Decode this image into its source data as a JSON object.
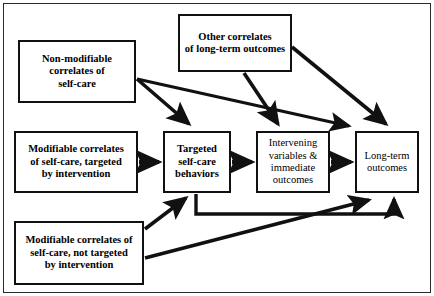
{
  "figure": {
    "background": "#ffffff",
    "line_color": "#111111",
    "border_color": "#2b2b2b",
    "width": 434,
    "height": 296
  },
  "nodes": {
    "non_modifiable": {
      "id": "non-modifiable-correlates",
      "lines": [
        "Non-modifiable",
        "correlates of",
        "self-care"
      ],
      "text": "Non-modifiable correlates of self-care",
      "style": "bold"
    },
    "other_correlates": {
      "id": "other-correlates",
      "lines": [
        "Other correlates",
        "of long-term outcomes"
      ],
      "text": "Other correlates of long-term outcomes",
      "style": "bold"
    },
    "modifiable_targeted": {
      "id": "modifiable-correlates-targeted",
      "lines": [
        "Modifiable correlates",
        "of self-care, targeted",
        "by intervention"
      ],
      "text": "Modifiable correlates of self-care, targeted by intervention",
      "style": "bold"
    },
    "modifiable_not_targeted": {
      "id": "modifiable-correlates-not-targeted",
      "lines": [
        "Modifiable correlates of",
        "self-care, not targeted",
        "by intervention"
      ],
      "text": "Modifiable correlates of self-care, not targeted by intervention",
      "style": "bold"
    },
    "targeted_behaviors": {
      "id": "targeted-self-care-behaviors",
      "lines": [
        "Targeted",
        "self-care",
        "behaviors"
      ],
      "text": "Targeted self-care behaviors",
      "style": "bold"
    },
    "intervening": {
      "id": "intervening-variables",
      "lines": [
        "Intervening",
        "variables &",
        "immediate",
        "outcomes"
      ],
      "text": "Intervening variables & immediate outcomes",
      "style": "regular"
    },
    "long_term": {
      "id": "long-term-outcomes",
      "lines": [
        "Long-term",
        "outcomes"
      ],
      "text": "Long-term outcomes",
      "style": "regular"
    }
  },
  "edges": [
    {
      "id": "e1",
      "from": "non_modifiable",
      "to": "targeted_behaviors",
      "kind": "diagonal-down-right"
    },
    {
      "id": "e2",
      "from": "non_modifiable",
      "to": "long_term",
      "kind": "shallow-diagonal-right"
    },
    {
      "id": "e3",
      "from": "other_correlates",
      "to": "intervening",
      "kind": "diagonal-down-right"
    },
    {
      "id": "e4",
      "from": "other_correlates",
      "to": "long_term",
      "kind": "diagonal-down-right"
    },
    {
      "id": "e5",
      "from": "modifiable_targeted",
      "to": "targeted_behaviors",
      "kind": "horizontal"
    },
    {
      "id": "e6",
      "from": "targeted_behaviors",
      "to": "intervening",
      "kind": "horizontal"
    },
    {
      "id": "e7",
      "from": "intervening",
      "to": "long_term",
      "kind": "horizontal"
    },
    {
      "id": "e8",
      "from": "modifiable_not_targeted",
      "to": "targeted_behaviors",
      "kind": "diagonal-up-right"
    },
    {
      "id": "e9",
      "from": "modifiable_not_targeted",
      "to": "long_term",
      "kind": "shallow-diagonal-up-right"
    },
    {
      "id": "e10",
      "from": "targeted_behaviors",
      "to": "long_term",
      "kind": "orthogonal-down-right-up"
    }
  ]
}
